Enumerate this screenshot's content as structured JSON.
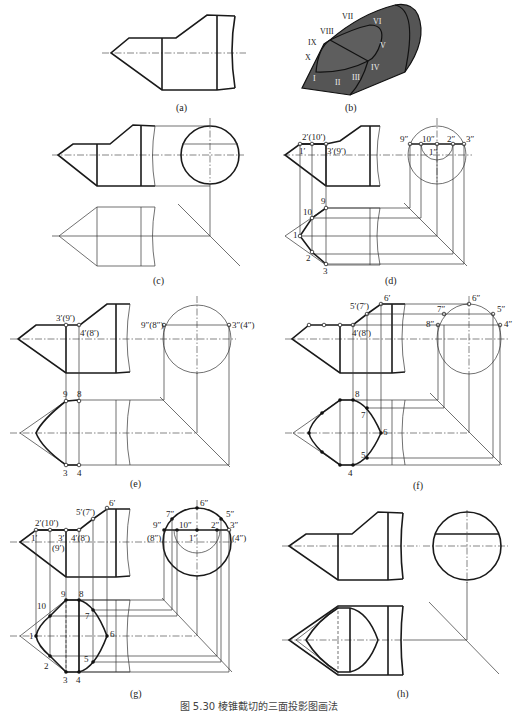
{
  "figure": {
    "caption": "图 5.30  棱锥截切的三面投影图画法",
    "panels": {
      "a": {
        "label": "(a)"
      },
      "b": {
        "label": "(b)",
        "roman_points": [
          "I",
          "II",
          "III",
          "IV",
          "V",
          "VI",
          "VII",
          "VIII",
          "IX",
          "X"
        ]
      },
      "c": {
        "label": "(c)"
      },
      "d": {
        "label": "(d)",
        "front_labels": [
          "2′(10′)",
          "1′",
          "3′(9′)"
        ],
        "side_labels": [
          "9″",
          "10″",
          "2″",
          "3″",
          "1″"
        ],
        "top_labels": [
          "9",
          "10",
          "1",
          "2",
          "3"
        ]
      },
      "e": {
        "label": "(e)",
        "front_labels": [
          "3′(9′)",
          "4′(8′)"
        ],
        "side_labels": [
          "9″(8″)",
          "3″(4″)"
        ],
        "top_labels": [
          "9",
          "8",
          "3",
          "4"
        ]
      },
      "f": {
        "label": "(f)",
        "front_labels": [
          "6′",
          "5′(7′)",
          "4′(8′)"
        ],
        "side_labels": [
          "6″",
          "7″",
          "5″",
          "8″",
          "4″"
        ],
        "top_labels": [
          "8",
          "7",
          "6",
          "5",
          "4"
        ]
      },
      "g": {
        "label": "(g)",
        "front_labels": [
          "6′",
          "5′(7′)",
          "2′(10′)",
          "1′",
          "3′",
          "(9′)",
          "4′(8′)"
        ],
        "side_labels": [
          "6″",
          "7″",
          "5″",
          "9″",
          "10″",
          "2″",
          "3″",
          "(8″)",
          "1″",
          "(4″)"
        ],
        "top_labels": [
          "9",
          "8",
          "10",
          "7",
          "1",
          "6",
          "2",
          "5",
          "3",
          "4"
        ]
      },
      "h": {
        "label": "(h)"
      }
    }
  }
}
